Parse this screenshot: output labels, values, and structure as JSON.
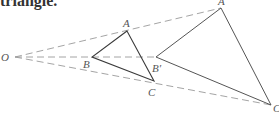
{
  "caption": "triangle.",
  "labels": {
    "O": "O",
    "A": "A",
    "B": "B",
    "C": "C",
    "A_prime": "A",
    "B_prime": "B′",
    "C_prime": "C"
  },
  "colors": {
    "dashed_rays": "#9a9a9a",
    "small_triangle": "#3a3a3a",
    "large_triangle": "#555555",
    "labels": "#555555"
  }
}
